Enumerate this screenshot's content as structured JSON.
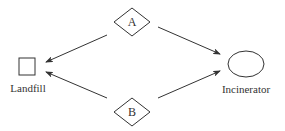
{
  "diagram": {
    "nodes": [
      {
        "id": "A",
        "label": "A",
        "shape": "diamond"
      },
      {
        "id": "B",
        "label": "B",
        "shape": "diamond"
      },
      {
        "id": "landfill",
        "label": "Landfill",
        "shape": "square"
      },
      {
        "id": "incinerator",
        "label": "Incinerator",
        "shape": "ellipse"
      }
    ],
    "edges": [
      {
        "from": "A",
        "to": "landfill"
      },
      {
        "from": "A",
        "to": "incinerator"
      },
      {
        "from": "B",
        "to": "landfill"
      },
      {
        "from": "B",
        "to": "incinerator"
      }
    ],
    "colors": {
      "stroke": "#333333",
      "background": "#ffffff"
    }
  }
}
